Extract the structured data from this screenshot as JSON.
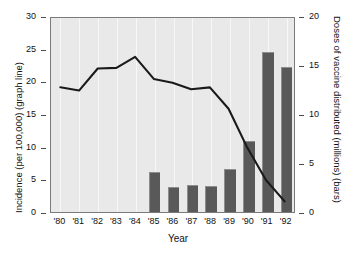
{
  "chart_data": {
    "type": "bar",
    "title": "",
    "xlabel": "Year",
    "categories": [
      "'80",
      "'81",
      "'82",
      "'83",
      "'84",
      "'85",
      "'86",
      "'87",
      "'88",
      "'89",
      "'90",
      "'91",
      "'92"
    ],
    "grid": "vertical",
    "legend_position": "none",
    "series": [
      {
        "name": "Doses of vaccine distributed (millions) (bars)",
        "type": "bar",
        "axis": "right",
        "color": "#595959",
        "values": [
          null,
          null,
          null,
          null,
          null,
          4.1,
          2.6,
          2.8,
          2.65,
          4.4,
          7.2,
          16.3,
          14.8
        ]
      },
      {
        "name": "Incidence (per 100,000) (graph line)",
        "type": "line",
        "axis": "left",
        "color": "#1a1a1a",
        "values": [
          19.3,
          18.8,
          22.2,
          22.3,
          24.0,
          20.6,
          20.0,
          19.0,
          19.3,
          16.0,
          10.0,
          5.0,
          1.7
        ]
      }
    ],
    "left_axis": {
      "label": "Incidence (per 100,000) (graph line)",
      "ylim": [
        0,
        30
      ],
      "ticks": [
        "0",
        "5",
        "10",
        "15",
        "20",
        "25",
        "30"
      ],
      "tick_values": [
        0,
        5,
        10,
        15,
        20,
        25,
        30
      ]
    },
    "right_axis": {
      "label": "Doses of vaccine distributed (millions) (bars)",
      "ylim": [
        0,
        20
      ],
      "ticks": [
        "0",
        "5",
        "10",
        "15",
        "20"
      ],
      "tick_values": [
        0,
        5,
        10,
        15,
        20
      ]
    },
    "colors": {
      "plot_background": "#e9e9e9",
      "bar_fill": "#595959",
      "line": "#1a1a1a",
      "gridline": "#f7f7f7",
      "frame": "#7a7a7a"
    }
  }
}
